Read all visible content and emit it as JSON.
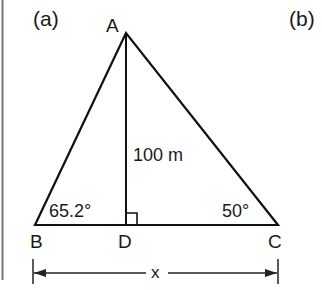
{
  "figure": {
    "panels": {
      "left": "(a)",
      "right": "(b)"
    },
    "points": {
      "A": "A",
      "B": "B",
      "C": "C",
      "D": "D"
    },
    "measurements": {
      "height_AD": "100 m",
      "angle_B": "65.2°",
      "angle_C": "50°",
      "base_BC": "x"
    },
    "colors": {
      "line": "#111111",
      "separator": "#777777",
      "background": "#ffffff"
    }
  }
}
